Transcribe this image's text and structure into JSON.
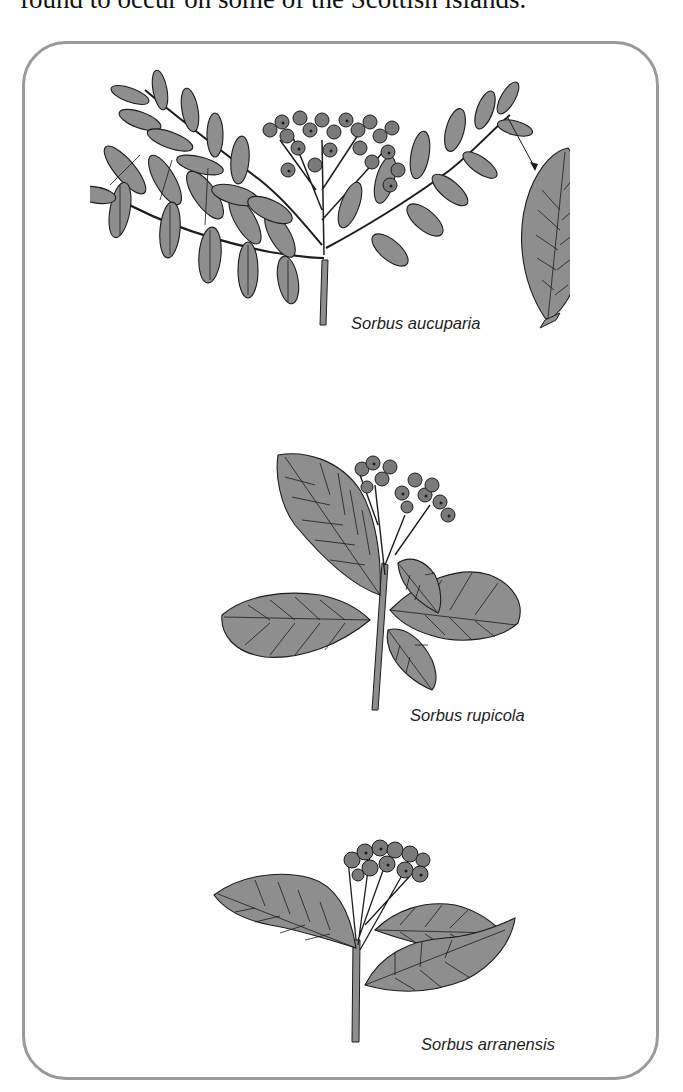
{
  "document": {
    "intro_text": "found to occur on some of the Scottish islands."
  },
  "figure": {
    "border_color": "#9a9a9a",
    "leaf_color": "#8e8e8e",
    "outline_color": "#1c1c1c",
    "plates": [
      {
        "id": "aucuparia",
        "caption": "Sorbus aucuparia",
        "detail": "compound pinnate leaf with berry cluster and enlarged leaflet detail"
      },
      {
        "id": "rupicola",
        "caption": "Sorbus rupicola",
        "detail": "simple serrated leaves with berry cluster"
      },
      {
        "id": "arranensis",
        "caption": "Sorbus arranensis",
        "detail": "lobed serrated leaves with berry cluster"
      }
    ]
  }
}
